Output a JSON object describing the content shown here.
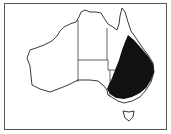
{
  "map": {
    "subject": "Australia distribution map",
    "region_shaded": "eastern Australia (Queensland, New South Wales, Victoria interior)",
    "colors": {
      "land": "#ffffff",
      "outline": "#222222",
      "range": "#111111",
      "frame": "#555555"
    }
  }
}
